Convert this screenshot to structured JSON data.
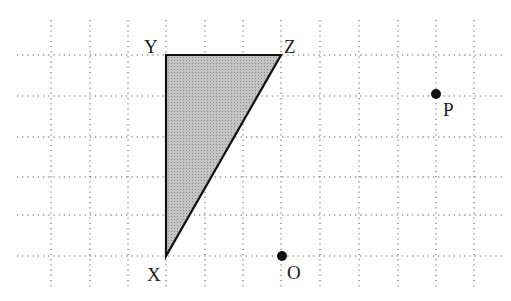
{
  "diagram": {
    "type": "grid-geometry",
    "grid": {
      "columns_x": [
        51,
        90,
        128,
        166,
        205,
        243,
        281,
        320,
        359,
        398,
        436,
        474
      ],
      "rows_y": [
        55,
        96,
        137,
        177,
        215,
        256
      ],
      "x_extent": [
        17,
        505
      ],
      "y_extent": [
        20,
        290
      ],
      "line_color": "#555555",
      "style": "dotted"
    },
    "triangle": {
      "name": "XYZ",
      "fill": "#b8b8b8",
      "stroke": "#111111",
      "vertices": {
        "X": {
          "x": 166,
          "y": 256
        },
        "Y": {
          "x": 166,
          "y": 55
        },
        "Z": {
          "x": 281,
          "y": 55
        }
      }
    },
    "points": [
      {
        "label": "O",
        "x": 282,
        "y": 256
      },
      {
        "label": "P",
        "x": 436,
        "y": 94
      }
    ],
    "labels": {
      "X": "X",
      "Y": "Y",
      "Z": "Z",
      "O": "O",
      "P": "P"
    }
  }
}
